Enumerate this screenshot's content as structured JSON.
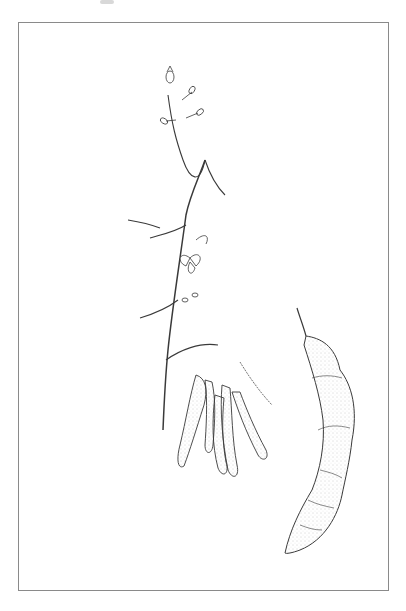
{
  "image": {
    "subject": "Botanical line illustration of a tamarind plant (Tamarindus indica)",
    "style": "pen-and-ink stipple drawing, black on white, thin grey frame",
    "colors": {
      "background": "#ffffff",
      "frame": "#8a8a8a",
      "ink": "#3a3a3a",
      "stipple": "#9a9a9a"
    },
    "elements": [
      {
        "name": "compound-leaf",
        "count": 7,
        "description": "pinnate leaves with many oblong leaflets"
      },
      {
        "name": "flower-raceme",
        "description": "terminal spike of flower buds at top"
      },
      {
        "name": "open-flower",
        "description": "small flower on central stem"
      },
      {
        "name": "pod-cluster",
        "description": "hanging group of young segmented pods"
      },
      {
        "name": "mature-pod",
        "description": "large curved stippled pod at right"
      }
    ]
  }
}
